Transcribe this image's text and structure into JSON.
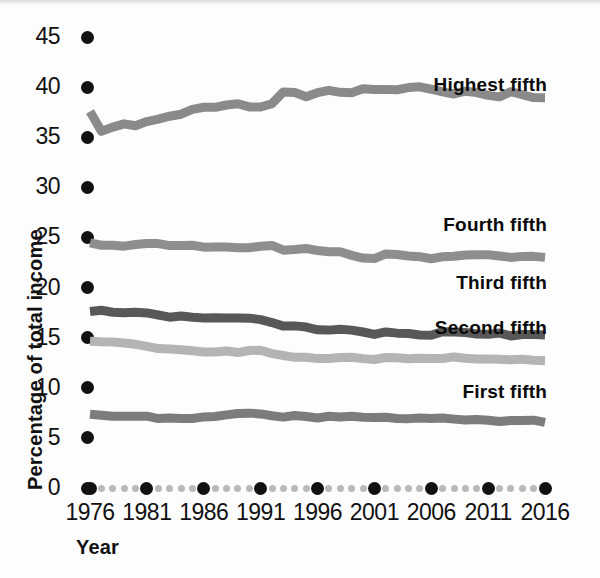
{
  "chart_data": {
    "type": "line",
    "title": "",
    "subtitle": "",
    "xlabel": "Year",
    "ylabel": "Percentage of total income",
    "xlim": [
      1976,
      2016
    ],
    "ylim": [
      0,
      45
    ],
    "ytick_step": 5,
    "grid": false,
    "legend_position": "inline-right-of-series",
    "x_major_tick_labels": [
      "1976",
      "1981",
      "1986",
      "1991",
      "1996",
      "2001",
      "2006",
      "2011",
      "2016"
    ],
    "x_major_tick_values": [
      1976,
      1981,
      1986,
      1991,
      1996,
      2001,
      2006,
      2011,
      2016
    ],
    "y_tick_labels": [
      "45",
      "40",
      "35",
      "30",
      "25",
      "20",
      "15",
      "10",
      "5",
      "0"
    ],
    "y_tick_values": [
      45,
      40,
      35,
      30,
      25,
      20,
      15,
      10,
      5,
      0
    ],
    "x": [
      1976,
      1977,
      1978,
      1979,
      1980,
      1981,
      1982,
      1983,
      1984,
      1985,
      1986,
      1987,
      1988,
      1989,
      1990,
      1991,
      1992,
      1993,
      1994,
      1995,
      1996,
      1997,
      1998,
      1999,
      2000,
      2001,
      2002,
      2003,
      2004,
      2005,
      2006,
      2007,
      2008,
      2009,
      2010,
      2011,
      2012,
      2013,
      2014,
      2015,
      2016
    ],
    "series": [
      {
        "name": "Highest fifth",
        "color": "#8a8a8a",
        "label_x": 2005,
        "label_y": 40.2,
        "values": [
          37.6,
          35.6,
          36.0,
          36.3,
          36.2,
          36.6,
          36.8,
          37.1,
          37.3,
          37.7,
          38.0,
          38.0,
          38.2,
          38.4,
          38.0,
          38.0,
          38.3,
          39.6,
          39.5,
          39.1,
          39.5,
          39.6,
          39.5,
          39.5,
          39.8,
          39.8,
          39.7,
          39.8,
          39.9,
          40.0,
          39.8,
          39.5,
          39.3,
          39.6,
          39.4,
          39.2,
          39.1,
          39.5,
          39.2,
          39.0,
          39.0
        ]
      },
      {
        "name": "Fourth fifth",
        "color": "#8e8e8e",
        "label_x": 2005,
        "label_y": 26.2,
        "values": [
          24.4,
          24.2,
          24.2,
          24.2,
          24.3,
          24.4,
          24.4,
          24.2,
          24.2,
          24.2,
          24.1,
          24.1,
          24.0,
          24.0,
          24.0,
          24.2,
          24.2,
          23.8,
          23.8,
          23.9,
          23.7,
          23.5,
          23.5,
          23.2,
          23.0,
          22.9,
          23.3,
          23.3,
          23.2,
          23.0,
          22.9,
          23.0,
          23.1,
          23.2,
          23.3,
          23.3,
          23.2,
          23.0,
          23.1,
          23.1,
          23.0
        ]
      },
      {
        "name": "Third fifth",
        "color": "#585858",
        "label_x": 2005,
        "label_y": 20.5,
        "values": [
          17.6,
          17.7,
          17.6,
          17.5,
          17.6,
          17.5,
          17.2,
          17.1,
          17.1,
          17.0,
          17.0,
          17.0,
          16.9,
          16.9,
          16.9,
          16.8,
          16.5,
          16.1,
          16.1,
          16.0,
          15.8,
          15.8,
          15.8,
          15.7,
          15.5,
          15.4,
          15.5,
          15.5,
          15.4,
          15.3,
          15.3,
          15.6,
          15.5,
          15.5,
          15.4,
          15.4,
          15.4,
          15.2,
          15.3,
          15.3,
          15.3
        ]
      },
      {
        "name": "Second fifth",
        "color": "#b4b4b4",
        "label_x": 2005,
        "label_y": 16.0,
        "values": [
          14.7,
          14.6,
          14.5,
          14.4,
          14.3,
          14.2,
          13.9,
          13.8,
          13.8,
          13.7,
          13.6,
          13.6,
          13.6,
          13.5,
          13.7,
          13.7,
          13.4,
          13.2,
          13.1,
          13.1,
          12.9,
          13.0,
          13.0,
          13.1,
          12.9,
          12.9,
          13.0,
          13.0,
          12.9,
          12.9,
          12.9,
          13.0,
          13.0,
          13.0,
          12.9,
          12.9,
          12.8,
          12.8,
          12.8,
          12.8,
          12.7
        ]
      },
      {
        "name": "First fifth",
        "color": "#7c7c7c",
        "label_x": 2005,
        "label_y": 9.6,
        "values": [
          7.3,
          7.2,
          7.2,
          7.1,
          7.1,
          7.2,
          7.0,
          7.0,
          7.0,
          7.0,
          7.1,
          7.2,
          7.3,
          7.4,
          7.5,
          7.4,
          7.2,
          7.0,
          7.3,
          7.2,
          7.0,
          7.2,
          7.1,
          7.2,
          7.1,
          7.0,
          7.0,
          7.0,
          7.0,
          7.0,
          7.0,
          7.0,
          6.9,
          6.8,
          6.8,
          6.8,
          6.7,
          6.8,
          6.7,
          6.7,
          6.6
        ]
      }
    ]
  },
  "axis": {
    "x_title": "Year",
    "y_title": "Percentage of total income"
  }
}
